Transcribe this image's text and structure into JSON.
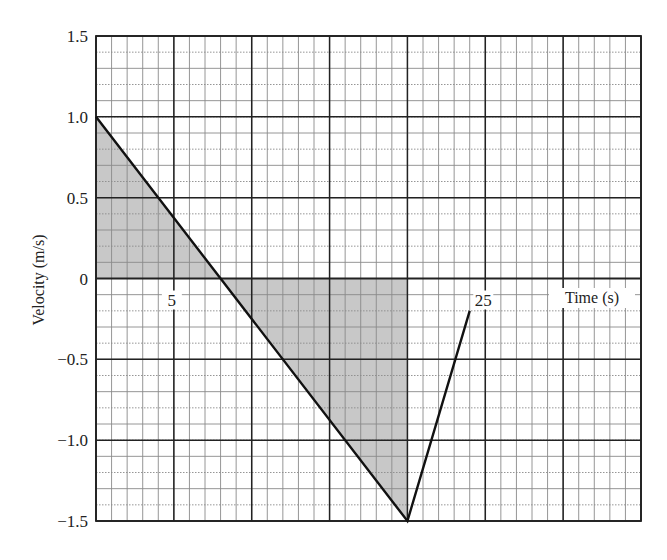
{
  "chart_data": {
    "type": "line",
    "title": "",
    "xlabel": "Time (s)",
    "ylabel": "Velocity (m/s)",
    "xlim": [
      0,
      35
    ],
    "ylim": [
      -1.5,
      1.5
    ],
    "grid": true,
    "x_major_step": 5,
    "x_minor_step": 1,
    "y_major_step": 0.5,
    "y_minor_step": 0.1,
    "x_tick_labels": [
      {
        "value": 5,
        "label": "5"
      },
      {
        "value": 25,
        "label": "25"
      }
    ],
    "y_tick_labels": [
      {
        "value": 1.5,
        "label": "1.5"
      },
      {
        "value": 1.0,
        "label": "1.0"
      },
      {
        "value": 0.5,
        "label": "0.5"
      },
      {
        "value": 0,
        "label": "0"
      },
      {
        "value": -0.5,
        "label": "-0.5"
      },
      {
        "value": -1.0,
        "label": "-1.0"
      },
      {
        "value": -1.5,
        "label": "-1.5"
      }
    ],
    "series": [
      {
        "name": "velocity",
        "x": [
          0,
          8,
          20,
          24
        ],
        "y": [
          1.0,
          0,
          -1.5,
          -0.2
        ]
      }
    ],
    "shaded_regions": [
      {
        "name": "positive-area",
        "points": [
          [
            0,
            0
          ],
          [
            0,
            1.0
          ],
          [
            8,
            0
          ]
        ]
      },
      {
        "name": "negative-area",
        "points": [
          [
            8,
            0
          ],
          [
            20,
            -1.5
          ],
          [
            20,
            0
          ]
        ]
      }
    ],
    "colors": {
      "line": "#111111",
      "shade": "#c8c8c8",
      "major_grid": "#222222",
      "minor_grid": "#8a8a8a"
    }
  }
}
